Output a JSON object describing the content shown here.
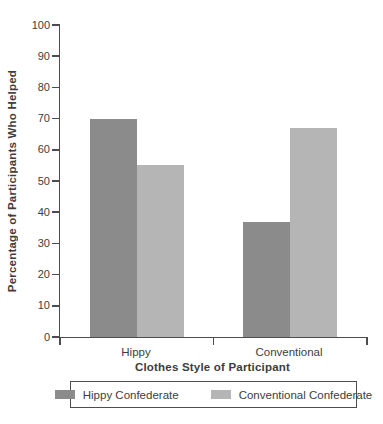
{
  "chart_data": {
    "type": "bar",
    "title": "",
    "categories": [
      "Hippy",
      "Conventional"
    ],
    "series": [
      {
        "name": "Hippy Confederate",
        "color": "#8b8b8b",
        "values": [
          70,
          37
        ]
      },
      {
        "name": "Conventional Confederate",
        "color": "#b5b5b5",
        "values": [
          55,
          67
        ]
      }
    ],
    "xlabel": "Clothes Style of Participant",
    "ylabel": "Percentage of Participants Who Helped",
    "ylim": [
      0,
      100
    ],
    "ytick_step": 10,
    "ytick_labels": [
      "0",
      "10",
      "20",
      "30",
      "40",
      "50",
      "60",
      "70",
      "80",
      "90",
      "100"
    ],
    "xtick_fractions": [
      0,
      0.5,
      1
    ],
    "grid": false,
    "legend_position": "bottom",
    "axis_color": "#4d4d4d",
    "text_color": "#3d3d3d",
    "background_color": "#ffffff"
  }
}
